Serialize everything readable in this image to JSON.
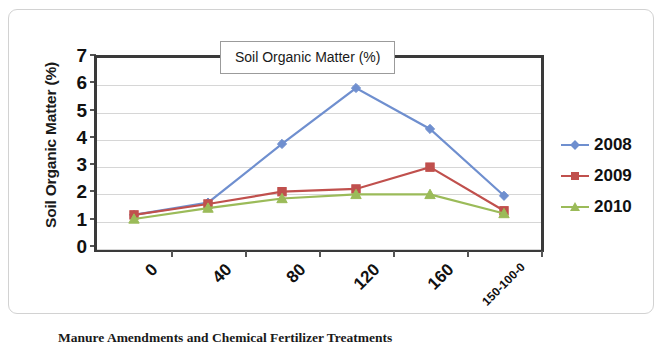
{
  "chart_data": {
    "type": "line",
    "title": "Soil Organic Matter (%)",
    "xlabel": "Manure Amendments and Chemical Fertilizer Treatments",
    "ylabel": "Soil Organic Matter (%)",
    "categories": [
      "0",
      "40",
      "80",
      "120",
      "160",
      "150-100-0"
    ],
    "ylim": [
      0,
      7
    ],
    "ytick_labels": [
      "0",
      "1",
      "2",
      "3",
      "4",
      "5",
      "6",
      "7"
    ],
    "ytick_values": [
      0,
      1,
      2,
      3,
      4,
      5,
      6,
      7
    ],
    "grid": true,
    "legend_position": "right",
    "series": [
      {
        "name": "2008",
        "color": "#6f8fcf",
        "marker": "diamond",
        "values": [
          1.25,
          1.7,
          3.85,
          5.9,
          4.4,
          1.95
        ]
      },
      {
        "name": "2009",
        "color": "#c0504d",
        "marker": "square",
        "values": [
          1.25,
          1.65,
          2.1,
          2.2,
          3.0,
          1.4
        ]
      },
      {
        "name": "2010",
        "color": "#9bbb59",
        "marker": "triangle",
        "values": [
          1.1,
          1.5,
          1.85,
          2.0,
          2.0,
          1.3
        ]
      }
    ]
  }
}
